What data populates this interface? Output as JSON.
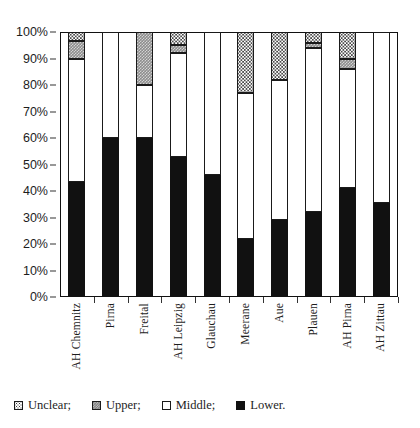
{
  "chart_data": {
    "type": "bar",
    "title": "",
    "subtitle": "",
    "xlabel": "",
    "ylabel": "",
    "stacked": true,
    "stack_mode": "percent",
    "grid": false,
    "legend_position": "bottom-left",
    "ylim": [
      0,
      100
    ],
    "y_tick_labels": [
      "0%",
      "10%",
      "20%",
      "30%",
      "40%",
      "50%",
      "60%",
      "70%",
      "80%",
      "90%",
      "100%"
    ],
    "y_tick_values": [
      0,
      10,
      20,
      30,
      40,
      50,
      60,
      70,
      80,
      90,
      100
    ],
    "categories": [
      "AH Chemnitz",
      "Pirna",
      "Freital",
      "AH Leipzig",
      "Glauchau",
      "Meerane",
      "Aue",
      "Plauen",
      "AH Pirna",
      "AH Zittau"
    ],
    "series": [
      {
        "name": "Lower",
        "legend_label": "Lower.",
        "pattern": "solid-black",
        "color": "#111111",
        "values": [
          43.5,
          60,
          60,
          53,
          46,
          22,
          29,
          32,
          41,
          35.5
        ]
      },
      {
        "name": "Middle",
        "legend_label": "Middle;",
        "pattern": "solid-white",
        "color": "#ffffff",
        "values": [
          46.5,
          40,
          20,
          39,
          54,
          55,
          53,
          62,
          45,
          64.5
        ]
      },
      {
        "name": "Upper",
        "legend_label": "Upper;",
        "pattern": "dark-gray-checker",
        "color": "#8d8d8d",
        "values": [
          6.5,
          0,
          20,
          3,
          0,
          0,
          0,
          2,
          4,
          0
        ]
      },
      {
        "name": "Unclear",
        "legend_label": "Unclear;",
        "pattern": "light-dotted",
        "color": "#ffffff",
        "values": [
          3.5,
          0,
          0,
          5,
          0,
          23,
          18,
          4,
          10,
          0
        ]
      }
    ],
    "legend_entries": [
      {
        "label": "Unclear;",
        "series": "Unclear"
      },
      {
        "label": "Upper;",
        "series": "Upper"
      },
      {
        "label": "Middle;",
        "series": "Middle"
      },
      {
        "label": "Lower.",
        "series": "Lower"
      }
    ]
  }
}
